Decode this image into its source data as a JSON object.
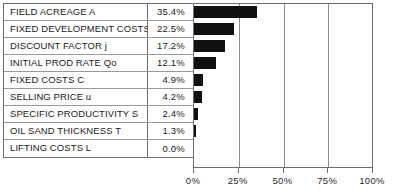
{
  "chart_data": {
    "type": "bar",
    "orientation": "horizontal",
    "title": "",
    "xlabel": "",
    "ylabel": "",
    "xlim": [
      0,
      100
    ],
    "grid": true,
    "legend": "none",
    "xticks": [
      "0%",
      "25%",
      "50%",
      "75%",
      "100%"
    ],
    "xtick_values": [
      0,
      25,
      50,
      75,
      100
    ],
    "categories": [
      "FIELD ACREAGE A",
      "FIXED DEVELOPMENT COSTS",
      "DISCOUNT FACTOR j",
      "INITIAL PROD RATE Qo",
      "FIXED COSTS C",
      "SELLING PRICE u",
      "SPECIFIC PRODUCTIVITY S",
      "OIL SAND THICKNESS T",
      "LIFTING COSTS L"
    ],
    "values": [
      35.4,
      22.5,
      17.2,
      12.1,
      4.9,
      4.2,
      2.4,
      1.3,
      0.0
    ],
    "value_labels": [
      "35.4%",
      "22.5%",
      "17.2%",
      "12.1%",
      "4.9%",
      "4.2%",
      "2.4%",
      "1.3%",
      "0.0%"
    ],
    "bar_color": "#101010",
    "grid_color": "#8c8c8c",
    "background": "#ffffff"
  },
  "table": {
    "rows": [
      {
        "label": "FIELD ACREAGE A",
        "value": "35.4%"
      },
      {
        "label": "FIXED DEVELOPMENT COSTS",
        "value": "22.5%"
      },
      {
        "label": "DISCOUNT FACTOR j",
        "value": "17.2%"
      },
      {
        "label": "INITIAL PROD RATE Qo",
        "value": "12.1%"
      },
      {
        "label": "FIXED COSTS C",
        "value": "4.9%"
      },
      {
        "label": "SELLING PRICE u",
        "value": "4.2%"
      },
      {
        "label": "SPECIFIC PRODUCTIVITY S",
        "value": "2.4%"
      },
      {
        "label": "OIL SAND THICKNESS T",
        "value": "1.3%"
      },
      {
        "label": "LIFTING COSTS L",
        "value": "0.0%"
      }
    ]
  },
  "axis": {
    "ticks": [
      {
        "label": "0%",
        "value": 0
      },
      {
        "label": "25%",
        "value": 25
      },
      {
        "label": "50%",
        "value": 50
      },
      {
        "label": "75%",
        "value": 75
      },
      {
        "label": "100%",
        "value": 100
      }
    ]
  }
}
